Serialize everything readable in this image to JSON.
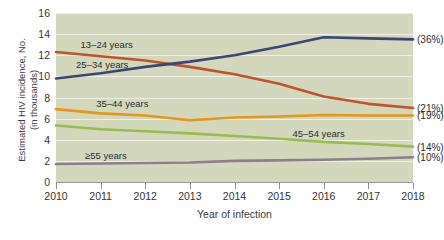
{
  "chart_data": {
    "type": "line",
    "title": "",
    "xlabel": "Year of infection",
    "ylabel_line1": "Estimated HIV incidence, No.",
    "ylabel_line2": "(in thousands)",
    "categories": [
      "2010",
      "2011",
      "2012",
      "2013",
      "2014",
      "2015",
      "2016",
      "2017",
      "2018"
    ],
    "x": [
      2010,
      2011,
      2012,
      2013,
      2014,
      2015,
      2016,
      2017,
      2018
    ],
    "xlim": [
      2010,
      2018
    ],
    "ylim": [
      0,
      16
    ],
    "yticks": [
      "0",
      "2",
      "4",
      "6",
      "8",
      "10",
      "12",
      "14",
      "16"
    ],
    "ytick_values": [
      0,
      2,
      4,
      6,
      8,
      10,
      12,
      14,
      16
    ],
    "grid": true,
    "legend_position": "inline-annotations",
    "series": [
      {
        "name": "13–24 years",
        "color": "#c0532a",
        "values": [
          12.3,
          11.9,
          11.5,
          10.9,
          10.2,
          9.3,
          8.1,
          7.4,
          7.0
        ],
        "end_label": "(21%)",
        "label_x": 2010.55,
        "label_y": 13.0
      },
      {
        "name": "25–34 years",
        "color": "#3d4575",
        "values": [
          9.8,
          10.3,
          10.9,
          11.4,
          12.0,
          12.8,
          13.7,
          13.6,
          13.5
        ],
        "end_label": "(36%)",
        "label_x": 2010.45,
        "label_y": 11.1
      },
      {
        "name": "35–44 years",
        "color": "#e8941f",
        "values": [
          6.9,
          6.5,
          6.3,
          5.85,
          6.1,
          6.2,
          6.35,
          6.3,
          6.3
        ],
        "end_label": "(19%)",
        "label_x": 2010.9,
        "label_y": 7.35
      },
      {
        "name": "45–54 years",
        "color": "#9cbb4f",
        "values": [
          5.35,
          5.0,
          4.8,
          4.6,
          4.35,
          4.1,
          3.8,
          3.6,
          3.35
        ],
        "end_label": "(14%)",
        "label_x": 2015.3,
        "label_y": 4.55
      },
      {
        "name": "≥55 years",
        "color": "#8a7f8c",
        "values": [
          1.7,
          1.75,
          1.8,
          1.85,
          2.0,
          2.05,
          2.1,
          2.2,
          2.35
        ],
        "end_label": "(10%)",
        "label_x": 2010.65,
        "label_y": 2.5
      }
    ]
  }
}
